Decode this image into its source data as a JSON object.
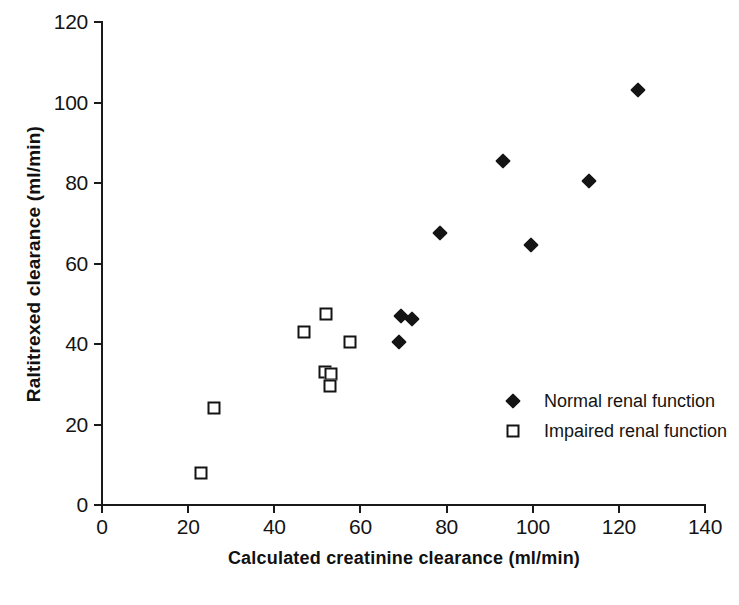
{
  "chart_data": {
    "type": "scatter",
    "title": "",
    "xlabel": "Calculated creatinine clearance (ml/min)",
    "ylabel": "Raltitrexed clearance (ml/min)",
    "xlim": [
      0,
      140
    ],
    "ylim": [
      0,
      120
    ],
    "xticks": [
      0,
      20,
      40,
      60,
      80,
      100,
      120,
      140
    ],
    "yticks": [
      0,
      20,
      40,
      60,
      80,
      100,
      120
    ],
    "grid": false,
    "legend_position": "inside-right",
    "series": [
      {
        "name": "Normal renal function",
        "marker": "filled-diamond",
        "color": "#141414",
        "points": [
          {
            "x": 69.0,
            "y": 40.5
          },
          {
            "x": 69.5,
            "y": 47.0
          },
          {
            "x": 72.0,
            "y": 46.3
          },
          {
            "x": 78.5,
            "y": 67.5
          },
          {
            "x": 93.0,
            "y": 85.5
          },
          {
            "x": 99.5,
            "y": 64.5
          },
          {
            "x": 113.0,
            "y": 80.5
          },
          {
            "x": 124.5,
            "y": 103.0
          }
        ]
      },
      {
        "name": "Impaired renal function",
        "marker": "open-square",
        "color": "#141414",
        "points": [
          {
            "x": 23.0,
            "y": 8.0
          },
          {
            "x": 26.0,
            "y": 24.0
          },
          {
            "x": 47.0,
            "y": 43.0
          },
          {
            "x": 52.0,
            "y": 47.5
          },
          {
            "x": 51.8,
            "y": 33.0
          },
          {
            "x": 53.2,
            "y": 32.5
          },
          {
            "x": 53.0,
            "y": 29.5
          },
          {
            "x": 57.5,
            "y": 40.5
          }
        ]
      }
    ]
  },
  "legend": {
    "items": [
      {
        "label": "Normal renal function",
        "marker": "filled-diamond"
      },
      {
        "label": "Impaired renal function",
        "marker": "open-square"
      }
    ]
  },
  "colors": {
    "ink": "#141414",
    "background": "#ffffff"
  }
}
